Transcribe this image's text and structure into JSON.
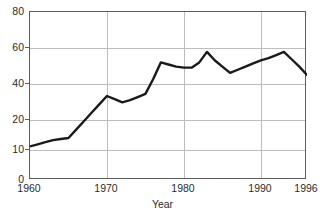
{
  "chart_data": {
    "type": "line",
    "title": "",
    "xlabel": "Year",
    "ylabel": "",
    "xlim": [
      1960,
      1996
    ],
    "ylim": [
      0,
      80
    ],
    "grid": true,
    "legend": "none",
    "xticks": [
      1960,
      1970,
      1980,
      1990,
      1996
    ],
    "xtick_labels": [
      "1960",
      "1970",
      "1980",
      "1990",
      "1996"
    ],
    "yticks": [
      0,
      10,
      20,
      40,
      60,
      80
    ],
    "ytick_labels": [
      "0",
      "10",
      "20",
      "40",
      "60",
      "80"
    ],
    "series": [
      {
        "name": "value",
        "x": [
          1960,
          1961,
          1962,
          1963,
          1964,
          1965,
          1966,
          1967,
          1968,
          1969,
          1970,
          1971,
          1972,
          1973,
          1974,
          1975,
          1976,
          1977,
          1978,
          1979,
          1980,
          1981,
          1982,
          1983,
          1984,
          1985,
          1986,
          1987,
          1988,
          1989,
          1990,
          1991,
          1992,
          1993,
          1994,
          1995,
          1996
        ],
        "values": [
          16,
          17,
          18,
          19,
          19.5,
          20,
          24,
          28,
          32,
          36,
          40,
          38.5,
          37,
          38,
          39.5,
          41,
          48,
          56,
          55,
          54,
          53.5,
          53.5,
          56,
          61,
          57,
          54,
          51,
          52.5,
          54,
          55.5,
          57,
          58,
          59.5,
          61,
          57.5,
          54,
          50
        ]
      }
    ],
    "line_color": "#1a1a1a",
    "grid_color": "#bdbdbd",
    "frame_color": "#5d5d5d"
  },
  "labels": {
    "y": {
      "t0": "0",
      "t10": "10",
      "t20": "20",
      "t40": "40",
      "t60": "60",
      "t80": "80"
    },
    "x": {
      "x1960": "1960",
      "x1970": "1970",
      "x1980": "1980",
      "x1990": "1990",
      "x1996": "1996"
    },
    "axis_title_x": "Year",
    "title_fragment": ""
  }
}
